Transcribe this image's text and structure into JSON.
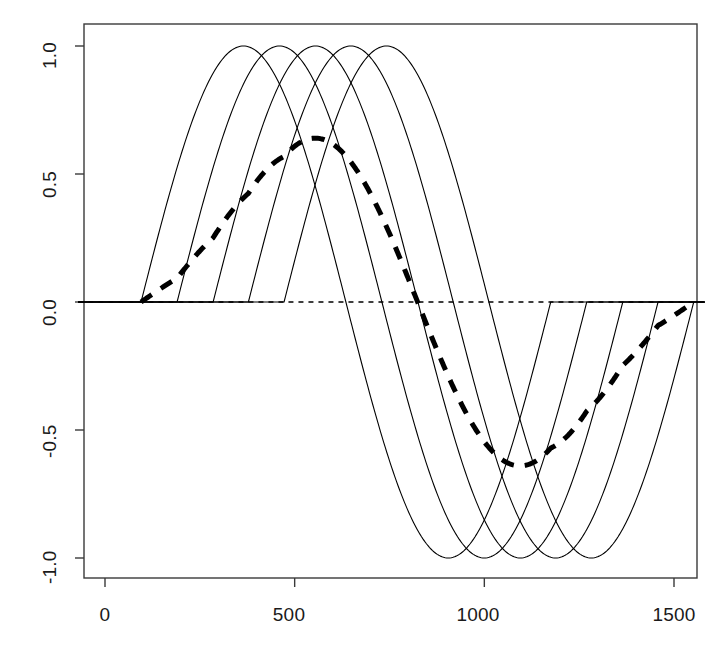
{
  "chart_data": {
    "type": "line",
    "title": "",
    "subtitle": "",
    "xlabel": "",
    "ylabel": "",
    "xlim": [
      -70,
      1580
    ],
    "ylim": [
      -1.08,
      1.08
    ],
    "grid": false,
    "legend": null,
    "x_ticks": [
      0,
      500,
      1000,
      1500
    ],
    "x_tick_labels": [
      "0",
      "500",
      "1000",
      "1500"
    ],
    "y_ticks": [
      1.0,
      0.5,
      0.0,
      -0.5,
      -1.0
    ],
    "y_tick_labels": [
      "1.0",
      "0.5",
      "0.0",
      "-0.5",
      "-1.0"
    ],
    "reference_line": {
      "name": "zero-line",
      "y": 0.0,
      "style": "dashed",
      "color": "#000000",
      "span": [
        -70,
        1580
      ]
    },
    "series": [
      {
        "name": "wave-1",
        "style": "solid",
        "color": "#000000",
        "width": 1.1,
        "type": "sine-burst",
        "phase_start": 95,
        "period": 1080,
        "amplitude": 1.0,
        "description": "full sine cycle, zero outside [95, 1175]"
      },
      {
        "name": "wave-2",
        "style": "solid",
        "color": "#000000",
        "width": 1.1,
        "type": "sine-burst",
        "phase_start": 190,
        "period": 1080,
        "amplitude": 1.0,
        "description": "full sine cycle, zero outside [190, 1270]"
      },
      {
        "name": "wave-3",
        "style": "solid",
        "color": "#000000",
        "width": 1.1,
        "type": "sine-burst",
        "phase_start": 285,
        "period": 1080,
        "amplitude": 1.0,
        "description": "full sine cycle, zero outside [285, 1365]"
      },
      {
        "name": "wave-4",
        "style": "solid",
        "color": "#000000",
        "width": 1.1,
        "type": "sine-burst",
        "phase_start": 378,
        "period": 1080,
        "amplitude": 1.0,
        "description": "full sine cycle, zero outside [378, 1458]"
      },
      {
        "name": "wave-5",
        "style": "solid",
        "color": "#000000",
        "width": 1.1,
        "type": "sine-burst",
        "phase_start": 472,
        "period": 1080,
        "amplitude": 1.0,
        "description": "full sine cycle, zero outside [472, 1552]"
      },
      {
        "name": "average-curve",
        "style": "dashed",
        "color": "#000000",
        "width": 5,
        "dash": [
          13,
          11
        ],
        "type": "mean-of-waves",
        "peak_x": 500,
        "peak_y": 0.64,
        "trough_x": 1030,
        "trough_y": -0.64,
        "start_x": 95,
        "end_x": 1552,
        "description": "thick dashed mean of the five sine bursts"
      }
    ],
    "axis_box": {
      "left": true,
      "right": true,
      "top": true,
      "bottom": true,
      "color": "#3a3a3a"
    }
  },
  "axes": {
    "y_labels": [
      "1.0",
      "0.5",
      "0.0",
      "-0.5",
      "-1.0"
    ],
    "x_labels": [
      "0",
      "500",
      "1000",
      "1500"
    ]
  }
}
